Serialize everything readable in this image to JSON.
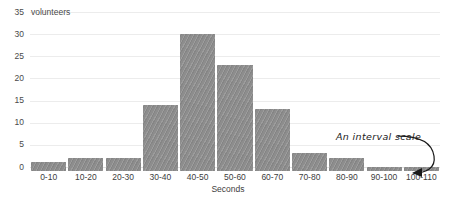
{
  "chart_data": {
    "type": "bar",
    "title": "",
    "subtitle": "",
    "xlabel": "Seconds",
    "ylabel": "volunteers",
    "ylim": [
      0,
      35
    ],
    "yticks": [
      0,
      5,
      10,
      15,
      20,
      25,
      30,
      35
    ],
    "ytick_labels": [
      "0",
      "5",
      "10",
      "15",
      "20",
      "25",
      "30",
      "35"
    ],
    "y_unit_label": "volunteers",
    "y_top_label": "35 volunteers",
    "grid": true,
    "legend": "none",
    "categories": [
      "0-10",
      "10-20",
      "20-30",
      "30-40",
      "40-50",
      "50-60",
      "60-70",
      "70-80",
      "80-90",
      "90-100",
      "100-110"
    ],
    "values": [
      2,
      3,
      3,
      15,
      31,
      24,
      14,
      4,
      3,
      1,
      1
    ],
    "bar_color": "#8d8d8d",
    "grid_color": "#ececec",
    "annotations": [
      {
        "text": "An interval scale",
        "style": "handwritten-italic",
        "points_to": "x-axis-tick-labels"
      }
    ]
  },
  "axis": {
    "y_ticks": [
      {
        "label": "35",
        "value": 35
      },
      {
        "label": "30",
        "value": 30
      },
      {
        "label": "25",
        "value": 25
      },
      {
        "label": "20",
        "value": 20
      },
      {
        "label": "15",
        "value": 15
      },
      {
        "label": "10",
        "value": 10
      },
      {
        "label": "5",
        "value": 5
      },
      {
        "label": "0",
        "value": 0
      }
    ],
    "y_unit": "volunteers",
    "x_title": "Seconds"
  },
  "annotation": {
    "label": "An interval scale"
  }
}
